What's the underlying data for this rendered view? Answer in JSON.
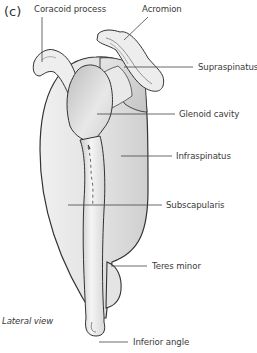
{
  "figure": {
    "panel_label": "(c)",
    "view_label": "Lateral view",
    "labels": {
      "coracoid_process": "Coracoid process",
      "acromion": "Acromion",
      "supraspinatus": "Supraspinatus",
      "glenoid_cavity": "Glenoid cavity",
      "infraspinatus": "Infraspinatus",
      "subscapularis": "Subscapularis",
      "teres_minor": "Teres minor",
      "inferior_angle": "Inferior angle"
    }
  },
  "colors": {
    "outline": "#333333",
    "muscle_fill": "#dcdcdc",
    "bone_fill": "#f2f2f2",
    "leader_line": "#444444"
  }
}
